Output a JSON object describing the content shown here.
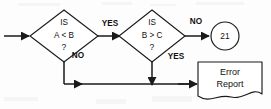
{
  "diagram": {
    "type": "flowchart",
    "title": "",
    "background_color": "#fdfdfd",
    "line_color": "#1a1a1a",
    "shape_fill": "#ffffff",
    "nodes": [
      {
        "id": "decision-1",
        "shape": "diamond",
        "lines": [
          "IS",
          "A < B",
          "?"
        ],
        "line1": "IS",
        "line2": "A < B",
        "line3": "?"
      },
      {
        "id": "decision-2",
        "shape": "diamond",
        "lines": [
          "IS",
          "B > C",
          "?"
        ],
        "line1": "IS",
        "line2": "B > C",
        "line3": "?"
      },
      {
        "id": "connector-21",
        "shape": "circle",
        "label": "21"
      },
      {
        "id": "error-report",
        "shape": "document",
        "line1": "Error",
        "line2": "Report"
      }
    ],
    "edges": [
      {
        "id": "entry",
        "from": "start",
        "to": "decision-1",
        "label": ""
      },
      {
        "id": "d1-yes",
        "from": "decision-1",
        "to": "decision-2",
        "label": "YES"
      },
      {
        "id": "d1-no",
        "from": "decision-1",
        "to": "error-report",
        "label": "NO"
      },
      {
        "id": "d2-no",
        "from": "decision-2",
        "to": "connector-21",
        "label": "NO"
      },
      {
        "id": "d2-yes",
        "from": "decision-2",
        "to": "error-report",
        "label": "YES"
      }
    ]
  }
}
